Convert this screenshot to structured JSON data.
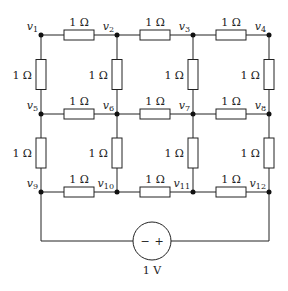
{
  "diagram": {
    "nodes": [
      {
        "id": "v1",
        "label": "v",
        "sub": "1",
        "x": 41,
        "y": 35
      },
      {
        "id": "v2",
        "label": "v",
        "sub": "2",
        "x": 117,
        "y": 35
      },
      {
        "id": "v3",
        "label": "v",
        "sub": "3",
        "x": 193,
        "y": 35
      },
      {
        "id": "v4",
        "label": "v",
        "sub": "4",
        "x": 269,
        "y": 35
      },
      {
        "id": "v5",
        "label": "v",
        "sub": "5",
        "x": 41,
        "y": 114
      },
      {
        "id": "v6",
        "label": "v",
        "sub": "6",
        "x": 117,
        "y": 114
      },
      {
        "id": "v7",
        "label": "v",
        "sub": "7",
        "x": 193,
        "y": 114
      },
      {
        "id": "v8",
        "label": "v",
        "sub": "8",
        "x": 269,
        "y": 114
      },
      {
        "id": "v9",
        "label": "v",
        "sub": "9",
        "x": 41,
        "y": 192
      },
      {
        "id": "v10",
        "label": "v",
        "sub": "10",
        "x": 117,
        "y": 192
      },
      {
        "id": "v11",
        "label": "v",
        "sub": "11",
        "x": 193,
        "y": 192
      },
      {
        "id": "v12",
        "label": "v",
        "sub": "12",
        "x": 269,
        "y": 192
      }
    ],
    "resistors": [
      {
        "from": "v1",
        "to": "v2",
        "value": "1 Ω",
        "orient": "h"
      },
      {
        "from": "v2",
        "to": "v3",
        "value": "1 Ω",
        "orient": "h"
      },
      {
        "from": "v3",
        "to": "v4",
        "value": "1 Ω",
        "orient": "h"
      },
      {
        "from": "v5",
        "to": "v6",
        "value": "1 Ω",
        "orient": "h"
      },
      {
        "from": "v6",
        "to": "v7",
        "value": "1 Ω",
        "orient": "h"
      },
      {
        "from": "v7",
        "to": "v8",
        "value": "1 Ω",
        "orient": "h"
      },
      {
        "from": "v9",
        "to": "v10",
        "value": "1 Ω",
        "orient": "h"
      },
      {
        "from": "v10",
        "to": "v11",
        "value": "1 Ω",
        "orient": "h"
      },
      {
        "from": "v11",
        "to": "v12",
        "value": "1 Ω",
        "orient": "h"
      },
      {
        "from": "v1",
        "to": "v5",
        "value": "1 Ω",
        "orient": "v"
      },
      {
        "from": "v2",
        "to": "v6",
        "value": "1 Ω",
        "orient": "v"
      },
      {
        "from": "v3",
        "to": "v7",
        "value": "1 Ω",
        "orient": "v"
      },
      {
        "from": "v4",
        "to": "v8",
        "value": "1 Ω",
        "orient": "v"
      },
      {
        "from": "v5",
        "to": "v9",
        "value": "1 Ω",
        "orient": "v"
      },
      {
        "from": "v6",
        "to": "v10",
        "value": "1 Ω",
        "orient": "v"
      },
      {
        "from": "v7",
        "to": "v11",
        "value": "1 Ω",
        "orient": "v"
      },
      {
        "from": "v8",
        "to": "v12",
        "value": "1 Ω",
        "orient": "v"
      }
    ],
    "source": {
      "type": "voltage-source",
      "value": "1 V",
      "minus": "−",
      "plus": "+",
      "cx": 152,
      "cy": 241,
      "r": 19,
      "left_node": "v9",
      "right_node": "v12"
    }
  }
}
